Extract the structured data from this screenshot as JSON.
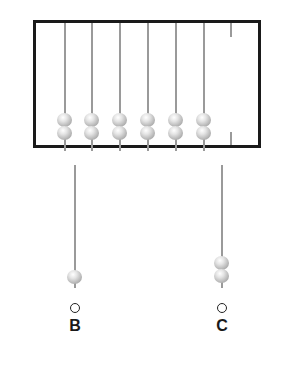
{
  "abacus_a": {
    "rods": [
      {
        "x": 65,
        "beads": 2
      },
      {
        "x": 92,
        "beads": 2
      },
      {
        "x": 120,
        "beads": 2
      },
      {
        "x": 148,
        "beads": 2
      },
      {
        "x": 176,
        "beads": 2
      },
      {
        "x": 204,
        "beads": 2
      }
    ],
    "stub_rod_x": 231,
    "stub_beads": 0
  },
  "option_b": {
    "label": "B",
    "rod_x": 75,
    "beads": 1
  },
  "option_c": {
    "label": "C",
    "rod_x": 222,
    "beads": 2
  },
  "colors": {
    "frame": "#1a1a1a",
    "rod": "#9a9a9a",
    "bead": "#c0c0c0"
  }
}
